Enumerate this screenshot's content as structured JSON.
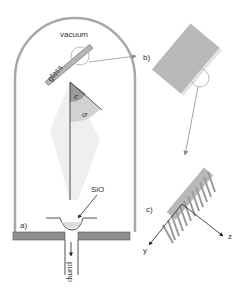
{
  "diagram": {
    "labels": {
      "vacuum": "vacuum",
      "glass": "glass",
      "epsilon": "ε",
      "sigma": "σ",
      "source": "SiO",
      "pump": "pump",
      "panel_a": "a)",
      "panel_b": "b)",
      "panel_c": "c)",
      "axis_y": "y",
      "axis_z": "z"
    },
    "colors": {
      "chamber_wall": "#a0a0a0",
      "substrate": "#b3b3b3",
      "vapor_plume": "#eeeeee",
      "sector_epsilon": "#9a9a9a",
      "sector_sigma": "#d0d0d0",
      "base_plate": "#8f8f8f",
      "line": "#222222"
    }
  }
}
